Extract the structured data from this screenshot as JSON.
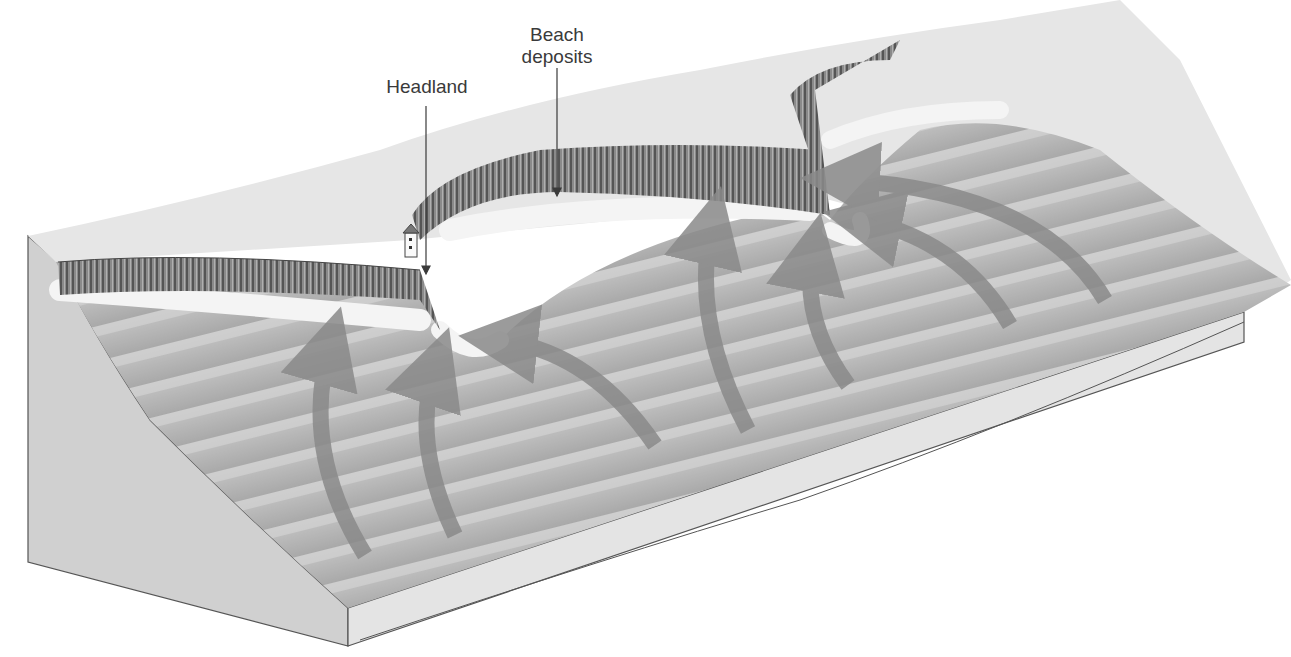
{
  "diagram": {
    "labels": {
      "headland": "Headland",
      "beach_deposits_line1": "Beach",
      "beach_deposits_line2": "deposits"
    },
    "colors": {
      "background": "#ffffff",
      "land_surface": "#e6e6e6",
      "cliff_face": "#7a7a7a",
      "beach_foam": "#f2f2f2",
      "water": "#b4b4b4",
      "wave_crest": "#cfcfcf",
      "wave_arrow": "#8a8a8a",
      "block_side": "#d2d2d2",
      "outline": "#555555",
      "label_text": "#3a3a3a"
    },
    "arrows_count": 8
  }
}
